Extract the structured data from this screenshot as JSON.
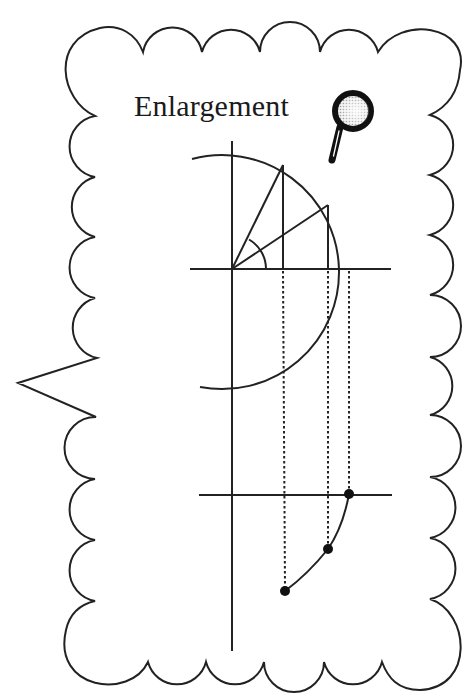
{
  "title": "Enlargement",
  "icons": {
    "magnifier": "magnifying-glass-icon"
  },
  "colors": {
    "stroke": "#222222",
    "background": "#ffffff",
    "lens_fill": "#d8d8d8"
  },
  "diagram": {
    "callout_shape": "scalloped speech bubble with left-pointing tail",
    "upper_figure": {
      "description": "Unit-circle style semicircle (right half) centered at origin with two radii and their vertical projections, angle arc at origin",
      "origin": [
        232,
        269
      ],
      "radius": 117,
      "radius_points": [
        [
          283,
          165
        ],
        [
          328,
          205
        ]
      ],
      "rightmost_point": [
        349,
        269
      ]
    },
    "lower_figure": {
      "description": "Projected points plotted below a second horizontal axis, joined by a curve",
      "axis_y": 495,
      "points": [
        [
          349,
          494
        ],
        [
          328,
          549
        ],
        [
          285,
          591
        ]
      ]
    },
    "dotted_projection_x": [
      283,
      328,
      349
    ]
  }
}
